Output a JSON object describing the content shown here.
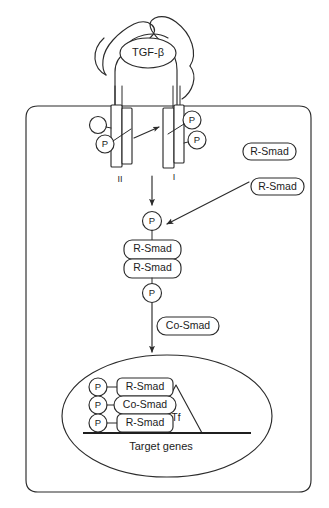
{
  "figure": {
    "type": "signaling-pathway-diagram",
    "line_color": "#2b2b2b",
    "background_color": "#ffffff"
  },
  "ligand": {
    "label": "TGF-β",
    "shape": "ellipse"
  },
  "receptors": [
    {
      "id": "receptor-ii",
      "label": "II",
      "phosphates": [
        "P"
      ],
      "has_empty_domain_circle": true
    },
    {
      "id": "receptor-i",
      "label": "I",
      "phosphates": [
        "P",
        "P"
      ],
      "has_empty_domain_circle": false
    }
  ],
  "cytoplasm": {
    "free_smads": [
      {
        "label": "R-Smad"
      },
      {
        "label": "R-Smad"
      }
    ],
    "phospho_upper": {
      "label": "P"
    },
    "complex_boxes": [
      {
        "label": "R-Smad"
      },
      {
        "label": "R-Smad"
      }
    ],
    "phospho_lower": {
      "label": "P"
    },
    "cofactor": {
      "label": "Co-Smad"
    }
  },
  "nucleus": {
    "complex_rows": [
      {
        "phosphate": "P",
        "label": "R-Smad"
      },
      {
        "phosphate": "P",
        "label": "Co-Smad"
      },
      {
        "phosphate": "P",
        "label": "R-Smad"
      }
    ],
    "transcription_factor": {
      "label": "Tf"
    },
    "dna_label": "Target genes"
  }
}
